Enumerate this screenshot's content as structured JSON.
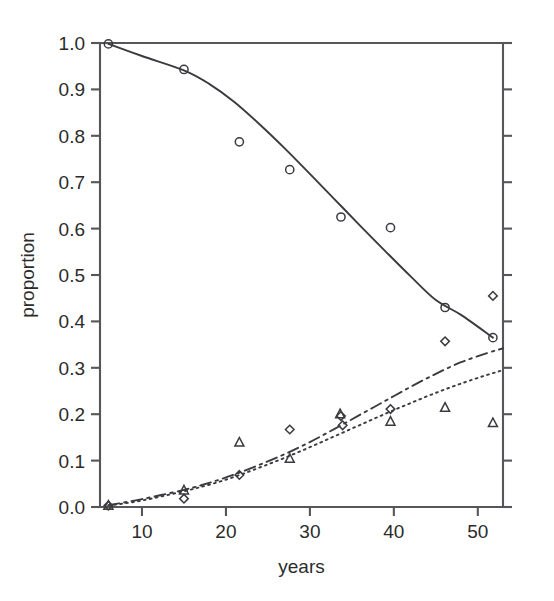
{
  "chart_data": {
    "type": "scatter",
    "title": "",
    "xlabel": "years",
    "ylabel": "proportion",
    "xlim": [
      5.0,
      53.0
    ],
    "ylim": [
      0.0,
      1.0
    ],
    "grid": false,
    "legend": "none",
    "xticks": [
      10,
      20,
      30,
      40,
      50
    ],
    "xtick_labels": [
      "10",
      "20",
      "30",
      "40",
      "50"
    ],
    "yticks": [
      0.0,
      0.1,
      0.2,
      0.3,
      0.4,
      0.5,
      0.6,
      0.7,
      0.8,
      0.9,
      1.0
    ],
    "ytick_labels": [
      "0.0",
      "0.1",
      "0.2",
      "0.3",
      "0.4",
      "0.5",
      "0.6",
      "0.7",
      "0.8",
      "0.9",
      "1.0"
    ],
    "series": [
      {
        "name": "circle-series",
        "marker": "open-circle",
        "line_style": "solid",
        "points": [
          {
            "x": 6.0,
            "y": 0.998
          },
          {
            "x": 15.0,
            "y": 0.943
          },
          {
            "x": 21.6,
            "y": 0.787
          },
          {
            "x": 27.6,
            "y": 0.727
          },
          {
            "x": 33.7,
            "y": 0.625
          },
          {
            "x": 39.6,
            "y": 0.602
          },
          {
            "x": 46.1,
            "y": 0.43
          },
          {
            "x": 51.8,
            "y": 0.365
          }
        ],
        "fit_line": [
          {
            "x": 6.0,
            "y": 0.998
          },
          {
            "x": 10.0,
            "y": 0.972
          },
          {
            "x": 15.0,
            "y": 0.941
          },
          {
            "x": 18.0,
            "y": 0.912
          },
          {
            "x": 21.0,
            "y": 0.873
          },
          {
            "x": 24.0,
            "y": 0.825
          },
          {
            "x": 27.0,
            "y": 0.773
          },
          {
            "x": 30.0,
            "y": 0.718
          },
          {
            "x": 33.0,
            "y": 0.662
          },
          {
            "x": 36.0,
            "y": 0.606
          },
          {
            "x": 39.0,
            "y": 0.551
          },
          {
            "x": 42.0,
            "y": 0.497
          },
          {
            "x": 45.0,
            "y": 0.446
          },
          {
            "x": 48.0,
            "y": 0.414
          },
          {
            "x": 51.8,
            "y": 0.365
          }
        ]
      },
      {
        "name": "diamond-series",
        "marker": "open-diamond",
        "line_style": "dash-dot",
        "points": [
          {
            "x": 6.0,
            "y": 0.003
          },
          {
            "x": 15.0,
            "y": 0.018
          },
          {
            "x": 21.6,
            "y": 0.069
          },
          {
            "x": 27.6,
            "y": 0.167
          },
          {
            "x": 33.7,
            "y": 0.196
          },
          {
            "x": 33.9,
            "y": 0.176
          },
          {
            "x": 39.6,
            "y": 0.211
          },
          {
            "x": 46.1,
            "y": 0.357
          },
          {
            "x": 51.8,
            "y": 0.455
          }
        ],
        "fit_line": [
          {
            "x": 6.0,
            "y": 0.004
          },
          {
            "x": 10.0,
            "y": 0.017
          },
          {
            "x": 15.0,
            "y": 0.037
          },
          {
            "x": 18.0,
            "y": 0.052
          },
          {
            "x": 21.0,
            "y": 0.07
          },
          {
            "x": 24.0,
            "y": 0.091
          },
          {
            "x": 27.0,
            "y": 0.114
          },
          {
            "x": 30.0,
            "y": 0.14
          },
          {
            "x": 33.0,
            "y": 0.169
          },
          {
            "x": 36.0,
            "y": 0.199
          },
          {
            "x": 39.0,
            "y": 0.229
          },
          {
            "x": 42.0,
            "y": 0.259
          },
          {
            "x": 45.0,
            "y": 0.287
          },
          {
            "x": 48.0,
            "y": 0.312
          },
          {
            "x": 51.0,
            "y": 0.331
          },
          {
            "x": 53.0,
            "y": 0.342
          }
        ]
      },
      {
        "name": "triangle-series",
        "marker": "open-triangle",
        "line_style": "dotted",
        "points": [
          {
            "x": 6.0,
            "y": 0.003
          },
          {
            "x": 15.0,
            "y": 0.036
          },
          {
            "x": 21.6,
            "y": 0.139
          },
          {
            "x": 27.6,
            "y": 0.104
          },
          {
            "x": 33.6,
            "y": 0.2
          },
          {
            "x": 39.6,
            "y": 0.184
          },
          {
            "x": 46.1,
            "y": 0.214
          },
          {
            "x": 51.8,
            "y": 0.181
          }
        ],
        "fit_line": [
          {
            "x": 6.0,
            "y": 0.003
          },
          {
            "x": 10.0,
            "y": 0.014
          },
          {
            "x": 15.0,
            "y": 0.034
          },
          {
            "x": 18.0,
            "y": 0.048
          },
          {
            "x": 21.0,
            "y": 0.065
          },
          {
            "x": 24.0,
            "y": 0.085
          },
          {
            "x": 27.0,
            "y": 0.106
          },
          {
            "x": 30.0,
            "y": 0.129
          },
          {
            "x": 33.0,
            "y": 0.153
          },
          {
            "x": 36.0,
            "y": 0.177
          },
          {
            "x": 39.0,
            "y": 0.201
          },
          {
            "x": 42.0,
            "y": 0.224
          },
          {
            "x": 45.0,
            "y": 0.246
          },
          {
            "x": 48.0,
            "y": 0.266
          },
          {
            "x": 51.0,
            "y": 0.284
          },
          {
            "x": 53.0,
            "y": 0.295
          }
        ]
      }
    ]
  },
  "style": {
    "axis_color": "#55555a",
    "line_color": "#3a3a3f",
    "marker_color": "#3a3a3f",
    "text_color": "#2b2b2b",
    "background": "#ffffff"
  },
  "geometry": {
    "plot_left": 100,
    "plot_right": 503,
    "plot_top": 43,
    "plot_bottom": 507
  }
}
